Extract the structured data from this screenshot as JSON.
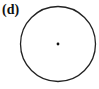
{
  "figure": {
    "label": "(d)",
    "circle": {
      "cx": 58,
      "cy": 44,
      "r": 37.5,
      "stroke": "#222222",
      "stroke_width": 1.3
    },
    "center_point": {
      "cx": 58,
      "cy": 44,
      "r": 1.4,
      "fill": "#111111"
    }
  }
}
